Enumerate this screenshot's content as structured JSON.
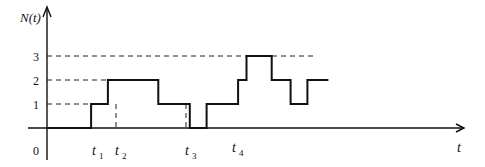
{
  "chart_data": {
    "type": "line",
    "subtype": "step",
    "title": "",
    "xlabel": "t",
    "ylabel": "N(t)",
    "ylim": [
      0,
      3
    ],
    "y_ticks": [
      0,
      1,
      2,
      3
    ],
    "y_tick_labels": [
      "0",
      "1",
      "2",
      "3"
    ],
    "grid": false,
    "dashed_reference_lines": [
      1,
      2,
      3
    ],
    "x_tick_labels": [
      {
        "label": "t",
        "sub": "1"
      },
      {
        "label": "t",
        "sub": "2"
      },
      {
        "label": "t",
        "sub": "3"
      },
      {
        "label": "t",
        "sub": "4"
      }
    ],
    "series": [
      {
        "name": "N(t)",
        "steps": [
          {
            "x_start": 0,
            "x_end": 0.21,
            "y": 0
          },
          {
            "x_start": 0.21,
            "x_end": 0.29,
            "y": 1
          },
          {
            "x_start": 0.29,
            "x_end": 0.53,
            "y": 2
          },
          {
            "x_start": 0.53,
            "x_end": 0.68,
            "y": 1
          },
          {
            "x_start": 0.68,
            "x_end": 0.76,
            "y": 0
          },
          {
            "x_start": 0.76,
            "x_end": 0.91,
            "y": 1
          },
          {
            "x_start": 0.91,
            "x_end": 0.95,
            "y": 2
          },
          {
            "x_start": 0.95,
            "x_end": 1.07,
            "y": 3
          },
          {
            "x_start": 1.07,
            "x_end": 1.16,
            "y": 2
          },
          {
            "x_start": 1.16,
            "x_end": 1.24,
            "y": 1
          },
          {
            "x_start": 1.24,
            "x_end": 1.34,
            "y": 2
          }
        ]
      }
    ],
    "event_times": {
      "t1": 0.21,
      "t2": 0.29,
      "t3": 0.53,
      "t4": 0.68
    },
    "layout": {
      "origin_px": [
        47,
        128
      ],
      "unit_y_px": 24,
      "x_px_per_unit": 210,
      "x_axis_end_px": 465,
      "y_axis_top_px": 6
    }
  },
  "labels": {
    "y_axis": "N(t)",
    "x_axis": "t",
    "origin": "0",
    "y1": "1",
    "y2": "2",
    "y3": "3",
    "t": "t",
    "sub1": "1",
    "sub2": "2",
    "sub3": "3",
    "sub4": "4"
  }
}
